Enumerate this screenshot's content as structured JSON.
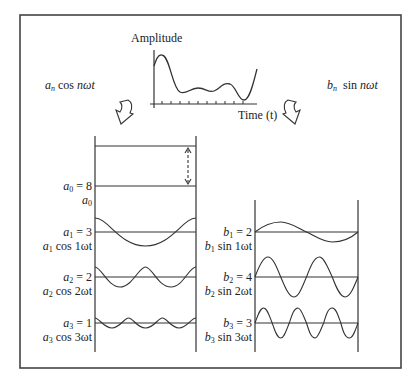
{
  "signal_plot": {
    "y_label": "Amplitude",
    "x_label": "Time (t)",
    "tick_count": 11
  },
  "left_branch": {
    "label": "a_n cos nωt",
    "label_coef": "a",
    "label_sub": "n",
    "label_rest": " cos nωt",
    "arrow": "curved-down-arrow",
    "rows": [
      {
        "coef_label": "a",
        "sub": "0",
        "value_text": " = 8",
        "term_label": "a",
        "term_sub": "0",
        "term_rest": "",
        "amplitude": 8,
        "harmonic": 0
      },
      {
        "coef_label": "a",
        "sub": "1",
        "value_text": " = 3",
        "term_label": "a",
        "term_sub": "1",
        "term_rest": " cos 1ωt",
        "amplitude": 3,
        "harmonic": 1
      },
      {
        "coef_label": "a",
        "sub": "2",
        "value_text": " = 2",
        "term_label": "a",
        "term_sub": "2",
        "term_rest": " cos 2ωt",
        "amplitude": 2,
        "harmonic": 2
      },
      {
        "coef_label": "a",
        "sub": "3",
        "value_text": " = 1",
        "term_label": "a",
        "term_sub": "3",
        "term_rest": " cos 3ωt",
        "amplitude": 1,
        "harmonic": 3
      }
    ]
  },
  "right_branch": {
    "label": "b_n sin nωt",
    "label_coef": "b",
    "label_sub": "n",
    "label_rest": "  sin nωt",
    "arrow": "curved-down-arrow",
    "rows": [
      {
        "coef_label": "b",
        "sub": "1",
        "value_text": " = 2",
        "term_label": "b",
        "term_sub": "1",
        "term_rest": " sin 1ωt",
        "amplitude": 2,
        "harmonic": 1
      },
      {
        "coef_label": "b",
        "sub": "2",
        "value_text": " = 4",
        "term_label": "b",
        "term_sub": "2",
        "term_rest": " sin 2ωt",
        "amplitude": 4,
        "harmonic": 2
      },
      {
        "coef_label": "b",
        "sub": "3",
        "value_text": " = 3",
        "term_label": "b",
        "term_sub": "3",
        "term_rest": " sin 3ωt",
        "amplitude": 3,
        "harmonic": 3
      }
    ]
  },
  "colors": {
    "line": "#333333",
    "frame": "#444444",
    "background": "#ffffff"
  }
}
